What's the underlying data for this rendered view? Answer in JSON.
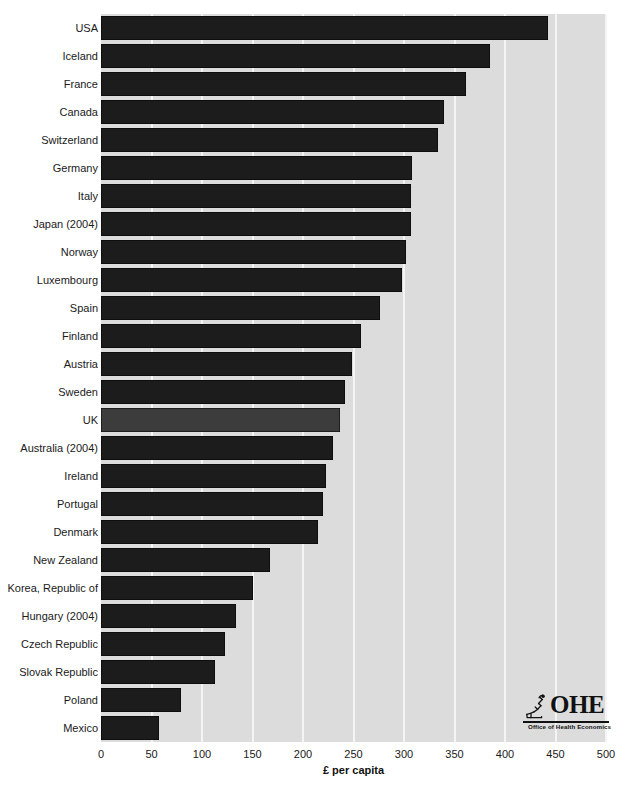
{
  "chart_data": {
    "type": "bar",
    "orientation": "horizontal",
    "title": "",
    "xlabel": "£ per capita",
    "ylabel": "",
    "xlim": [
      0,
      500
    ],
    "xticks": [
      0,
      50,
      100,
      150,
      200,
      250,
      300,
      350,
      400,
      450,
      500
    ],
    "grid": true,
    "legend": null,
    "categories": [
      "USA",
      "Iceland",
      "France",
      "Canada",
      "Switzerland",
      "Germany",
      "Italy",
      "Japan (2004)",
      "Norway",
      "Luxembourg",
      "Spain",
      "Finland",
      "Austria",
      "Sweden",
      "UK",
      "Australia (2004)",
      "Ireland",
      "Portugal",
      "Denmark",
      "New Zealand",
      "Korea, Republic of",
      "Hungary (2004)",
      "Czech Republic",
      "Slovak Republic",
      "Poland",
      "Mexico"
    ],
    "values": [
      443,
      385,
      361,
      340,
      334,
      308,
      307,
      307,
      302,
      298,
      276,
      257,
      249,
      242,
      237,
      230,
      223,
      220,
      215,
      167,
      150,
      134,
      123,
      113,
      79,
      57
    ],
    "highlight_category": "UK",
    "bar_color": "#1c1c1c",
    "highlight_color": "#3c3c3c",
    "plot_background": "#dcdcdc",
    "gridline_color": "#f4f4f4"
  },
  "logo": {
    "word": "OHE",
    "tagline": "Office of Health Economics",
    "mark": "microscope-icon"
  }
}
